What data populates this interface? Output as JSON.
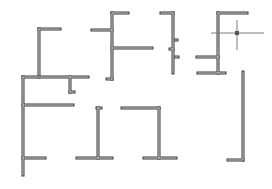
{
  "diagram": {
    "title": "",
    "background": "#ffffff",
    "stroke_color": "#3a3a3a",
    "fill_color": "#d8d8d8",
    "wall_thickness": 3,
    "shapes": [
      {
        "id": "shape-gamma-top-left",
        "segments": [
          {
            "x1": 39,
            "y1": 29,
            "x2": 39,
            "y2": 77
          },
          {
            "x1": 39,
            "y1": 29,
            "x2": 60,
            "y2": 29
          }
        ]
      },
      {
        "id": "shape-e-large",
        "segments": [
          {
            "x1": 23,
            "y1": 77,
            "x2": 23,
            "y2": 175
          },
          {
            "x1": 23,
            "y1": 77,
            "x2": 88,
            "y2": 77
          },
          {
            "x1": 23,
            "y1": 105,
            "x2": 73,
            "y2": 105
          },
          {
            "x1": 23,
            "y1": 158,
            "x2": 45,
            "y2": 158
          },
          {
            "x1": 70,
            "y1": 77,
            "x2": 70,
            "y2": 92
          },
          {
            "x1": 70,
            "y1": 92,
            "x2": 74,
            "y2": 92
          }
        ]
      },
      {
        "id": "shape-f-top-middle",
        "segments": [
          {
            "x1": 112,
            "y1": 13,
            "x2": 112,
            "y2": 79
          },
          {
            "x1": 112,
            "y1": 13,
            "x2": 128,
            "y2": 13
          },
          {
            "x1": 92,
            "y1": 30,
            "x2": 112,
            "y2": 30
          },
          {
            "x1": 112,
            "y1": 48,
            "x2": 152,
            "y2": 48
          },
          {
            "x1": 107,
            "y1": 79,
            "x2": 112,
            "y2": 79
          }
        ]
      },
      {
        "id": "shape-gamma-narrow",
        "segments": [
          {
            "x1": 173,
            "y1": 13,
            "x2": 173,
            "y2": 73
          },
          {
            "x1": 161,
            "y1": 13,
            "x2": 173,
            "y2": 13
          },
          {
            "x1": 175,
            "y1": 40,
            "x2": 177,
            "y2": 40
          },
          {
            "x1": 170,
            "y1": 49,
            "x2": 173,
            "y2": 49
          },
          {
            "x1": 175,
            "y1": 57,
            "x2": 178,
            "y2": 57
          }
        ]
      },
      {
        "id": "shape-f-right",
        "segments": [
          {
            "x1": 218,
            "y1": 13,
            "x2": 218,
            "y2": 73
          },
          {
            "x1": 218,
            "y1": 13,
            "x2": 247,
            "y2": 13
          },
          {
            "x1": 197,
            "y1": 57,
            "x2": 218,
            "y2": 57
          },
          {
            "x1": 198,
            "y1": 73,
            "x2": 225,
            "y2": 73
          }
        ]
      },
      {
        "id": "shape-t-bottom-left",
        "segments": [
          {
            "x1": 98,
            "y1": 108,
            "x2": 98,
            "y2": 158
          },
          {
            "x1": 97,
            "y1": 108,
            "x2": 101,
            "y2": 108
          },
          {
            "x1": 77,
            "y1": 158,
            "x2": 112,
            "y2": 158
          }
        ]
      },
      {
        "id": "shape-t-bottom-middle",
        "segments": [
          {
            "x1": 159,
            "y1": 108,
            "x2": 159,
            "y2": 158
          },
          {
            "x1": 122,
            "y1": 108,
            "x2": 159,
            "y2": 108
          },
          {
            "x1": 144,
            "y1": 158,
            "x2": 176,
            "y2": 158
          }
        ]
      },
      {
        "id": "shape-l-bottom-right",
        "segments": [
          {
            "x1": 243,
            "y1": 72,
            "x2": 243,
            "y2": 160
          },
          {
            "x1": 228,
            "y1": 160,
            "x2": 243,
            "y2": 160
          }
        ]
      }
    ],
    "crosshair": {
      "x": 237,
      "y": 33,
      "h_extent": [
        211,
        264
      ],
      "v_extent": [
        20,
        50
      ],
      "box_size": 4,
      "color": "#7a7a7a"
    }
  }
}
